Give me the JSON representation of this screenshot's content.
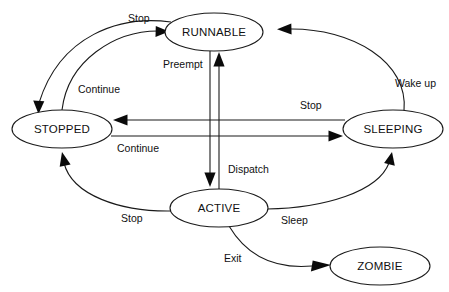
{
  "diagram": {
    "type": "state-machine",
    "background_color": "#ffffff",
    "stroke_color": "#1a1a1a",
    "states": [
      {
        "id": "runnable",
        "label": "RUNNABLE",
        "cx": 214,
        "cy": 32,
        "rx": 49,
        "ry": 19
      },
      {
        "id": "stopped",
        "label": "STOPPED",
        "cx": 62,
        "cy": 129,
        "rx": 50,
        "ry": 19
      },
      {
        "id": "sleeping",
        "label": "SLEEPING",
        "cx": 393,
        "cy": 129,
        "rx": 50,
        "ry": 19
      },
      {
        "id": "active",
        "label": "ACTIVE",
        "cx": 219,
        "cy": 208,
        "rx": 49,
        "ry": 19
      },
      {
        "id": "zombie",
        "label": "ZOMBIE",
        "cx": 380,
        "cy": 266,
        "rx": 50,
        "ry": 19
      }
    ],
    "transitions": [
      {
        "id": "runnable-to-stopped",
        "label": "Stop",
        "from": "RUNNABLE",
        "to": "STOPPED",
        "label_x": 128,
        "label_y": 19
      },
      {
        "id": "stopped-to-runnable",
        "label": "Continue",
        "from": "STOPPED",
        "to": "RUNNABLE",
        "label_x": 78,
        "label_y": 90
      },
      {
        "id": "active-to-runnable",
        "label": "Preempt",
        "from": "ACTIVE",
        "to": "RUNNABLE",
        "label_x": 163,
        "label_y": 65
      },
      {
        "id": "runnable-to-active",
        "label": "Dispatch",
        "from": "RUNNABLE",
        "to": "ACTIVE",
        "label_x": 228,
        "label_y": 170
      },
      {
        "id": "sleeping-to-stopped",
        "label": "Stop",
        "from": "SLEEPING",
        "to": "STOPPED",
        "label_x": 300,
        "label_y": 106
      },
      {
        "id": "stopped-to-sleeping",
        "label": "Continue",
        "from": "STOPPED",
        "to": "SLEEPING",
        "label_x": 117,
        "label_y": 149
      },
      {
        "id": "sleeping-to-runnable",
        "label": "Wake up",
        "from": "SLEEPING",
        "to": "RUNNABLE",
        "label_x": 395,
        "label_y": 84
      },
      {
        "id": "active-to-stopped",
        "label": "Stop",
        "from": "ACTIVE",
        "to": "STOPPED",
        "label_x": 121,
        "label_y": 219
      },
      {
        "id": "active-to-sleeping",
        "label": "Sleep",
        "from": "ACTIVE",
        "to": "SLEEPING",
        "label_x": 281,
        "label_y": 221
      },
      {
        "id": "active-to-zombie",
        "label": "Exit",
        "from": "ACTIVE",
        "to": "ZOMBIE",
        "label_x": 224,
        "label_y": 259
      }
    ]
  }
}
